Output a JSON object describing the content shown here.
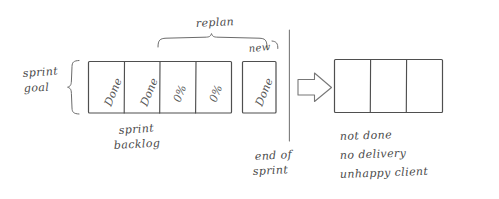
{
  "diagram": {
    "style": "hand-drawn sketch",
    "ink_color": "#4f4f4f",
    "background_color": "#ffffff"
  },
  "labels": {
    "replan": "replan",
    "new": "new",
    "sprint_goal_line1": "sprint",
    "sprint_goal_line2": "goal",
    "sprint_backlog_line1": "sprint",
    "sprint_backlog_line2": "backlog",
    "end_of_sprint_line1": "end of",
    "end_of_sprint_line2": "sprint"
  },
  "sprint_backlog": {
    "name": "sprint backlog",
    "cells": [
      {
        "label": "Done",
        "status": "done"
      },
      {
        "label": "Done",
        "status": "done"
      },
      {
        "label": "0%",
        "status": "not-started"
      },
      {
        "label": "0%",
        "status": "not-started"
      }
    ]
  },
  "new_item": {
    "label": "Done",
    "tag": "new",
    "status": "done"
  },
  "outcome_boxes": {
    "name": "delivered increment",
    "cells": [
      "",
      "",
      ""
    ],
    "count": 3
  },
  "outcome_text": {
    "lines": [
      "not done",
      "no delivery",
      "unhappy client"
    ]
  },
  "icons": {
    "arrow": "right-arrow-icon",
    "left_brace": "curly-brace-icon",
    "top_brace": "curly-brace-icon",
    "divider": "vertical-divider-icon"
  }
}
